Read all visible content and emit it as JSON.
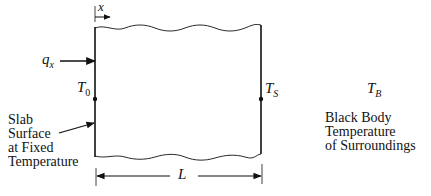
{
  "diagram": {
    "type": "slab-heat-transfer",
    "labels": {
      "x_axis": "x",
      "heat_flux": {
        "base": "q",
        "sub": "x"
      },
      "left_temp": {
        "base": "T",
        "sub": "0"
      },
      "right_temp": {
        "base": "T",
        "sub": "S"
      },
      "surroundings_temp": {
        "base": "T",
        "sub": "B"
      },
      "length": "L"
    },
    "annotations": {
      "left_surface": [
        "Slab",
        "Surface",
        "at Fixed",
        "Temperature"
      ],
      "surroundings": [
        "Black Body",
        "Temperature",
        "of Surroundings"
      ]
    },
    "colors": {
      "line": "#111111",
      "background": "#ffffff"
    }
  }
}
